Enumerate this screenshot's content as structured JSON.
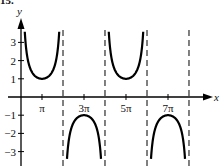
{
  "header": {
    "problem_number": "15."
  },
  "chart_data": {
    "type": "line",
    "title": "",
    "function": "y = csc(x/2)",
    "xlabel": "x",
    "ylabel": "y",
    "x_ticks": [
      {
        "value": 3.14159,
        "label": "π"
      },
      {
        "value": 9.42478,
        "label": "3π"
      },
      {
        "value": 15.70796,
        "label": "5π"
      },
      {
        "value": 21.99115,
        "label": "7π"
      }
    ],
    "y_ticks": [
      {
        "value": 3,
        "label": "3"
      },
      {
        "value": 2,
        "label": "2"
      },
      {
        "value": 1,
        "label": "1"
      },
      {
        "value": -1,
        "label": "−1"
      },
      {
        "value": -2,
        "label": "−2"
      },
      {
        "value": -3,
        "label": "−3"
      }
    ],
    "asymptotes_x": [
      "2π",
      "4π",
      "6π",
      "8π"
    ],
    "asymptote_values": [
      6.28319,
      12.56637,
      18.84956,
      25.13274
    ],
    "key_points": [
      {
        "x": "π",
        "y": 1,
        "type": "local min"
      },
      {
        "x": "3π",
        "y": -1,
        "type": "local max"
      },
      {
        "x": "5π",
        "y": 1,
        "type": "local min"
      },
      {
        "x": "7π",
        "y": -1,
        "type": "local max"
      }
    ],
    "xlim": [
      0,
      26.5
    ],
    "ylim": [
      -3.5,
      3.7
    ],
    "grid": false,
    "legend": null,
    "colors": {
      "curve": "#000000",
      "axis": "#000000",
      "asymptote": "#000000"
    }
  }
}
